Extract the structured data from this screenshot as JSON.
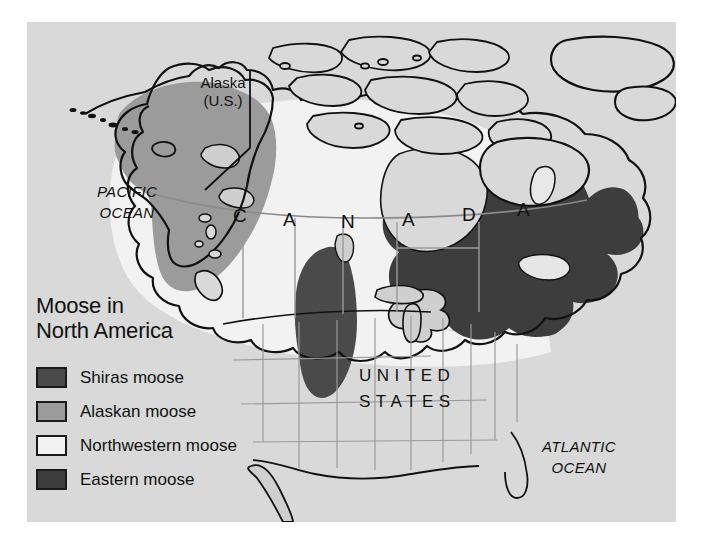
{
  "map": {
    "title_lines": [
      "Moose in",
      "North America"
    ],
    "background_color": "#d9d9d9",
    "outline_color": "#111111",
    "legend": [
      {
        "label": "Shiras moose",
        "color": "#4a4a4a",
        "icon": "legend-swatch-icon"
      },
      {
        "label": "Alaskan moose",
        "color": "#9b9b9b",
        "icon": "legend-swatch-icon"
      },
      {
        "label": "Northwestern moose",
        "color": "#f2f2f2",
        "icon": "legend-swatch-icon"
      },
      {
        "label": "Eastern moose",
        "color": "#3d3d3d",
        "icon": "legend-swatch-icon"
      }
    ],
    "ocean_labels": [
      {
        "name": "pacific-ocean",
        "line1": "PACIFIC",
        "line2": "OCEAN"
      },
      {
        "name": "atlantic-ocean",
        "line1": "ATLANTIC",
        "line2": "OCEAN"
      }
    ],
    "place_labels": {
      "alaska_line1": "Alaska",
      "alaska_line2": "(U.S.)",
      "canada_letters": [
        "C",
        "A",
        "N",
        "A",
        "D",
        "A"
      ],
      "united_states_line1": "UNITED",
      "united_states_line2": "STATES"
    }
  }
}
